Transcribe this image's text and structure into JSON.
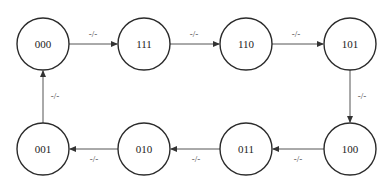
{
  "diagram": {
    "type": "state-transition",
    "states": [
      {
        "id": "s0",
        "label": "000",
        "cx": 43,
        "cy": 44
      },
      {
        "id": "s1",
        "label": "111",
        "cx": 144,
        "cy": 44
      },
      {
        "id": "s2",
        "label": "110",
        "cx": 246,
        "cy": 44
      },
      {
        "id": "s3",
        "label": "101",
        "cx": 350,
        "cy": 44
      },
      {
        "id": "s4",
        "label": "100",
        "cx": 350,
        "cy": 149
      },
      {
        "id": "s5",
        "label": "011",
        "cx": 246,
        "cy": 149
      },
      {
        "id": "s6",
        "label": "010",
        "cx": 144,
        "cy": 149
      },
      {
        "id": "s7",
        "label": "001",
        "cx": 43,
        "cy": 149
      }
    ],
    "radius": 26,
    "transitions": [
      {
        "from": "000",
        "to": "111",
        "label": "-/-"
      },
      {
        "from": "111",
        "to": "110",
        "label": "-/-"
      },
      {
        "from": "110",
        "to": "101",
        "label": "-/-"
      },
      {
        "from": "101",
        "to": "100",
        "label": "-/-"
      },
      {
        "from": "100",
        "to": "011",
        "label": "-/-"
      },
      {
        "from": "011",
        "to": "010",
        "label": "-/-"
      },
      {
        "from": "010",
        "to": "001",
        "label": "-/-"
      },
      {
        "from": "001",
        "to": "000",
        "label": "-/-"
      }
    ]
  }
}
